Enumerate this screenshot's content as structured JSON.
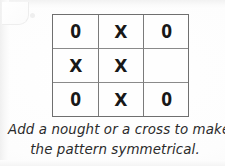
{
  "worksheet": {
    "background_color": "#fdfdfd",
    "ink_color": "#181818",
    "grid_line_color": "#7a7a7a",
    "grid": {
      "rows": 3,
      "columns": 3,
      "cells": [
        [
          {
            "value": "0",
            "kind": "nought"
          },
          {
            "value": "X",
            "kind": "cross"
          },
          {
            "value": "0",
            "kind": "nought"
          }
        ],
        [
          {
            "value": "X",
            "kind": "cross"
          },
          {
            "value": "X",
            "kind": "cross"
          },
          {
            "value": "",
            "kind": "empty"
          }
        ],
        [
          {
            "value": "0",
            "kind": "nought"
          },
          {
            "value": "X",
            "kind": "cross"
          },
          {
            "value": "0",
            "kind": "nought"
          }
        ]
      ]
    },
    "caption": {
      "line1": "Add a nought or a cross to make",
      "line2": "the pattern symmetrical."
    }
  }
}
